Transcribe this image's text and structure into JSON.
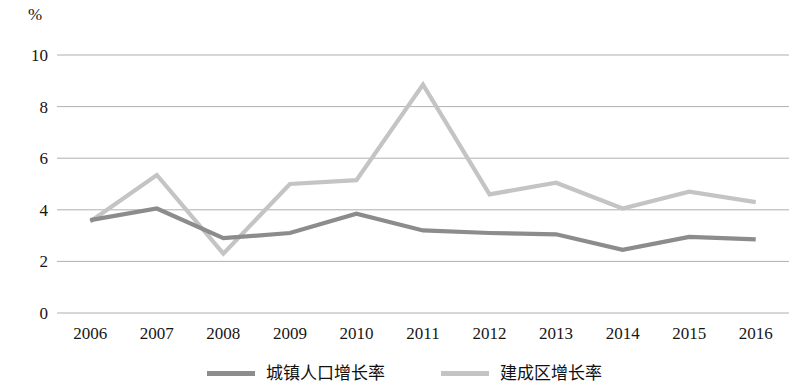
{
  "chart_data": {
    "type": "line",
    "title": "",
    "subtitle": "",
    "xlabel": "",
    "ylabel": "%",
    "unit_label": "%",
    "categories": [
      "2006",
      "2007",
      "2008",
      "2009",
      "2010",
      "2011",
      "2012",
      "2013",
      "2014",
      "2015",
      "2016"
    ],
    "x": [
      2006,
      2007,
      2008,
      2009,
      2010,
      2011,
      2012,
      2013,
      2014,
      2015,
      2016
    ],
    "ylim": [
      0,
      10
    ],
    "yticks": [
      0,
      2,
      4,
      6,
      8,
      10
    ],
    "ytick_labels": [
      "0",
      "2",
      "4",
      "6",
      "8",
      "10"
    ],
    "grid": true,
    "grid_axis": "y",
    "legend_position": "bottom",
    "series": [
      {
        "name": "城镇人口增长率",
        "color": "#8c8c8c",
        "values": [
          3.6,
          4.05,
          2.9,
          3.1,
          3.85,
          3.2,
          3.1,
          3.05,
          2.45,
          2.95,
          2.85
        ]
      },
      {
        "name": "建成区增长率",
        "color": "#c4c4c4",
        "values": [
          3.55,
          5.35,
          2.3,
          5.0,
          5.15,
          8.85,
          4.6,
          5.05,
          4.05,
          4.7,
          4.3
        ]
      }
    ]
  },
  "legend": {
    "entries": [
      {
        "label": "城镇人口增长率",
        "color": "#8c8c8c",
        "swatch": "line-swatch-dark"
      },
      {
        "label": "建成区增长率",
        "color": "#c4c4c4",
        "swatch": "line-swatch-light"
      }
    ]
  },
  "colors": {
    "gridline": "#9a9a9a",
    "series_urban_population": "#8c8c8c",
    "series_built_up_area": "#c4c4c4",
    "text": "#161616",
    "background": "#ffffff"
  }
}
